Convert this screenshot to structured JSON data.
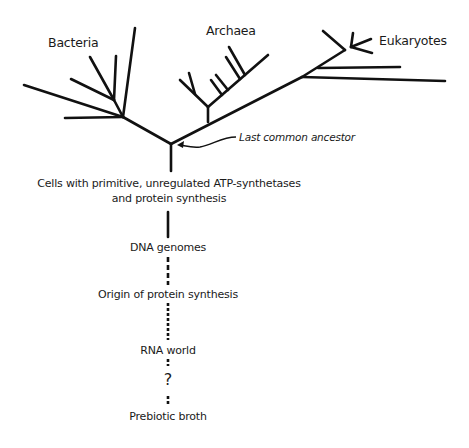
{
  "diagram": {
    "type": "phylogenetic-tree",
    "domains": {
      "bacteria": "Bacteria",
      "archaea": "Archaea",
      "eukaryotes": "Eukaryotes"
    },
    "ancestor_label": "Last common ancestor",
    "stages": [
      {
        "label": "Cells with primitive, unregulated ATP-synthetases",
        "line2": "and protein synthesis",
        "connector": "solid"
      },
      {
        "label": "DNA genomes",
        "connector": "dashed"
      },
      {
        "label": "Origin of protein synthesis",
        "connector": "dotted-dashed"
      },
      {
        "label": "RNA world",
        "connector": "short-dashes"
      },
      {
        "label": "?",
        "connector": "short-dashes"
      },
      {
        "label": "Prebiotic broth"
      }
    ],
    "colors": {
      "ink": "#111111",
      "background": "#ffffff"
    }
  }
}
